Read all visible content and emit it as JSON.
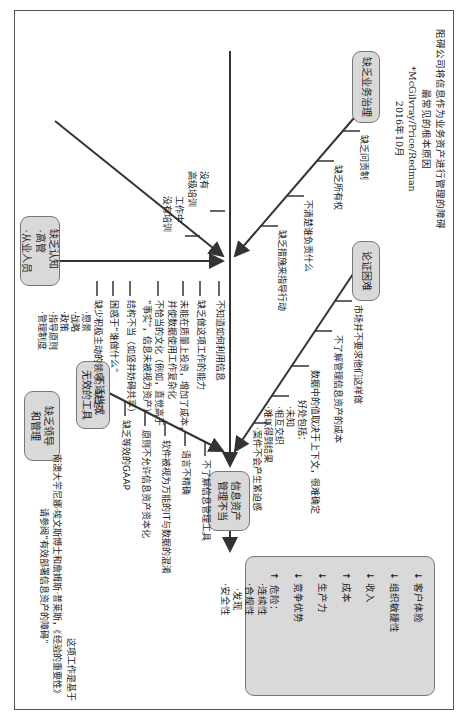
{
  "title": {
    "line1": "阻碍公司将信息作为业务资产进行管理的障碍",
    "line2": "最常见的根本原因",
    "line3": "*McGilvray/Price/Redman",
    "line4": "2016年10月"
  },
  "head": {
    "label": "信息资产\n管理不当"
  },
  "effects": [
    {
      "arrow": "down",
      "label": "客户体验"
    },
    {
      "arrow": "down",
      "label": "组织敏捷性"
    },
    {
      "arrow": "down",
      "label": "收入"
    },
    {
      "arrow": "up",
      "label": "成本"
    },
    {
      "arrow": "down",
      "label": "生产力"
    },
    {
      "arrow": "down",
      "label": "竞争优势"
    },
    {
      "arrow": "up",
      "label": "危险：",
      "sub": [
        "·连续性",
        "·合规性",
        "·发现",
        "·安全性"
      ]
    }
  ],
  "causes": {
    "justification": {
      "box": "论证困难",
      "items": [
        "市场并不要求他们这样做",
        "不了解管理信息资产的成本",
        "数据中的值取决于上下文，很难确定",
        "好处包括：",
        "·未知",
        "·相互交织",
        "·难以得到结果",
        "·案件不会产生紧迫感"
      ]
    },
    "governance": {
      "box": "缺乏业务治理",
      "items": [
        "缺乏问责制",
        "缺乏所有权",
        "不清楚谁负责什么",
        "缺乏措施来指导行动"
      ]
    },
    "tools": {
      "box": "不适当或\n无效的工具",
      "items": [
        "不了解信息管理工具",
        "语言不精确",
        "软件被视为万能的IT与数据的混淆",
        "原则不允许信息资产资本化",
        "缺乏等效的GAAP"
      ]
    },
    "awareness": {
      "box": "缺乏认知\n·高管\n·从业人员",
      "items": [
        "没有\n高级培训",
        "工作中\n没有培训"
      ]
    },
    "leadership": {
      "box": "缺乏领导\n和管理",
      "items": [
        "不知道如何利用信息",
        "缺乏做这项工作的能力",
        "未能在质量上投资，增加了成本，\n并使数据使用工作复杂化",
        "不恰当的文化（例如，直觉高于\n“事实”，信息未被视为资产）",
        "结构不当（如竖井妨碍共享）",
        "困惑于“谁做什么”",
        "缺少积极主动的领导。缺乏：",
        "·愿景",
        "·战略",
        "·政策",
        "·指导原则",
        "·管理制度"
      ]
    }
  },
  "footnote": {
    "line1": "这项工作是基于",
    "line2": "南澳大学尼娜·埃文斯博士和詹姆斯·普莱斯，《经验的重要性》",
    "line3": "请参阅“有效部署信息资产的障碍”"
  },
  "colors": {
    "box_fill": "#d9d9d9",
    "line": "#333333",
    "border": "#555555"
  }
}
